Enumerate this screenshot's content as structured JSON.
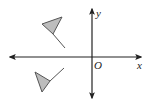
{
  "diagram": {
    "title": "",
    "type": "coordinate-plane-reflection",
    "axes": {
      "x_label": "x",
      "y_label": "y",
      "origin_label": "O",
      "color": "#222222"
    },
    "shapes": [
      {
        "name": "upper-flag",
        "quadrant": "II",
        "fill": "#bdbdbd",
        "stroke": "#555555",
        "triangle": [
          [
            42,
            24
          ],
          [
            62,
            17
          ],
          [
            53,
            34
          ]
        ],
        "pole": [
          [
            53,
            34
          ],
          [
            65,
            48
          ]
        ]
      },
      {
        "name": "lower-flag",
        "quadrant": "III",
        "fill": "#bdbdbd",
        "stroke": "#555555",
        "triangle": [
          [
            35,
            72
          ],
          [
            50,
            81
          ],
          [
            42,
            92
          ]
        ],
        "pole": [
          [
            50,
            81
          ],
          [
            64,
            68
          ]
        ]
      }
    ]
  }
}
